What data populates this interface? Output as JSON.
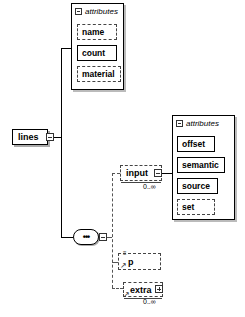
{
  "diagram": {
    "root": {
      "name": "lines",
      "toggle": "collapse"
    },
    "root_attributes": {
      "header": "attributes",
      "items": [
        {
          "name": "name",
          "use": "optional"
        },
        {
          "name": "count",
          "use": "required"
        },
        {
          "name": "material",
          "use": "optional"
        }
      ]
    },
    "compositor": {
      "type": "sequence",
      "symbol": "•••"
    },
    "children": [
      {
        "name": "input",
        "use": "optional",
        "occurrence": "0..∞",
        "toggle": "collapse",
        "attributes": {
          "header": "attributes",
          "items": [
            {
              "name": "offset",
              "use": "required"
            },
            {
              "name": "semantic",
              "use": "required"
            },
            {
              "name": "source",
              "use": "required"
            },
            {
              "name": "set",
              "use": "optional"
            }
          ]
        }
      },
      {
        "name": "p",
        "use": "optional",
        "marker": "≡"
      },
      {
        "name": "extra",
        "use": "optional",
        "occurrence": "0..∞",
        "toggle": "expand"
      }
    ]
  }
}
